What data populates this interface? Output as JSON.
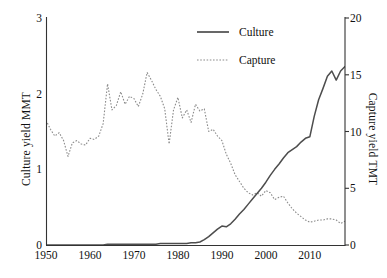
{
  "chart_data": {
    "type": "line",
    "title": "",
    "xlabel": "",
    "ylabel": "Culture yield MMT",
    "ylabel_secondary": "Capture yield TMT",
    "xlim": [
      1950,
      2018
    ],
    "ylim": [
      0,
      3
    ],
    "ylim_secondary": [
      0,
      20
    ],
    "grid": false,
    "legend_position": "top-center",
    "x_ticks": [
      1950,
      1960,
      1970,
      1980,
      1990,
      2000,
      2010
    ],
    "y_ticks_left": [
      0,
      1,
      2,
      3
    ],
    "y_ticks_right": [
      0,
      5,
      10,
      15,
      20
    ],
    "x": [
      1950,
      1951,
      1952,
      1953,
      1954,
      1955,
      1956,
      1957,
      1958,
      1959,
      1960,
      1961,
      1962,
      1963,
      1964,
      1965,
      1966,
      1967,
      1968,
      1969,
      1970,
      1971,
      1972,
      1973,
      1974,
      1975,
      1976,
      1977,
      1978,
      1979,
      1980,
      1981,
      1982,
      1983,
      1984,
      1985,
      1986,
      1987,
      1988,
      1989,
      1990,
      1991,
      1992,
      1993,
      1994,
      1995,
      1996,
      1997,
      1998,
      1999,
      2000,
      2001,
      2002,
      2003,
      2004,
      2005,
      2006,
      2007,
      2008,
      2009,
      2010,
      2011,
      2012,
      2013,
      2014,
      2015,
      2016,
      2017,
      2018
    ],
    "series": [
      {
        "name": "Culture",
        "axis": "left",
        "unit": "MMT",
        "style": "solid",
        "color": "#4d4d4d",
        "values": [
          0.0,
          0.0,
          0.0,
          0.0,
          0.0,
          0.0,
          0.0,
          0.0,
          0.0,
          0.0,
          0.0,
          0.0,
          0.0,
          0.0,
          0.01,
          0.01,
          0.01,
          0.01,
          0.01,
          0.01,
          0.01,
          0.01,
          0.01,
          0.01,
          0.01,
          0.01,
          0.02,
          0.02,
          0.02,
          0.02,
          0.02,
          0.02,
          0.02,
          0.03,
          0.03,
          0.04,
          0.07,
          0.11,
          0.16,
          0.21,
          0.25,
          0.24,
          0.28,
          0.34,
          0.41,
          0.47,
          0.54,
          0.61,
          0.68,
          0.75,
          0.83,
          0.92,
          1.0,
          1.07,
          1.15,
          1.22,
          1.26,
          1.3,
          1.36,
          1.41,
          1.43,
          1.7,
          1.92,
          2.07,
          2.23,
          2.3,
          2.18,
          2.3,
          2.36
        ]
      },
      {
        "name": "Capture",
        "axis": "right",
        "unit": "TMT",
        "style": "dotted",
        "color": "#8c8c8c",
        "values": [
          11.0,
          10.2,
          9.6,
          9.9,
          9.2,
          7.8,
          9.0,
          9.2,
          8.9,
          8.8,
          9.4,
          9.3,
          9.6,
          10.7,
          14.2,
          11.9,
          12.3,
          13.5,
          12.4,
          13.1,
          12.9,
          12.2,
          13.3,
          15.2,
          14.5,
          13.7,
          13.1,
          12.0,
          8.9,
          11.9,
          13.0,
          11.2,
          11.9,
          10.8,
          12.4,
          11.8,
          12.0,
          10.0,
          10.2,
          9.6,
          9.2,
          8.0,
          7.2,
          6.2,
          5.6,
          5.0,
          4.6,
          4.4,
          4.6,
          4.3,
          4.8,
          4.6,
          4.0,
          4.2,
          4.3,
          3.7,
          3.2,
          2.8,
          2.5,
          2.2,
          2.0,
          2.1,
          2.2,
          2.2,
          2.3,
          2.3,
          2.2,
          1.9,
          2.1
        ]
      }
    ],
    "legend": [
      {
        "label": "Culture",
        "style": "solid"
      },
      {
        "label": "Capture",
        "style": "dotted"
      }
    ]
  }
}
